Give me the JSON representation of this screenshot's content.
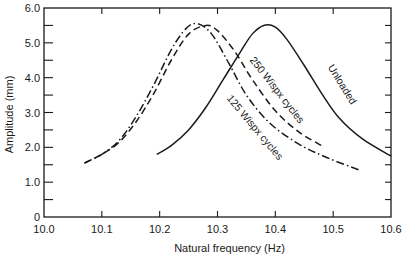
{
  "chart_data": {
    "type": "line",
    "title": "",
    "xlabel": "Natural frequency (Hz)",
    "ylabel": "Amplitude (mm)",
    "xlim": [
      10.0,
      10.6
    ],
    "ylim": [
      0,
      6.0
    ],
    "x_ticks": [
      10.0,
      10.1,
      10.2,
      10.3,
      10.4,
      10.5,
      10.6
    ],
    "x_tick_labels": [
      "10.0",
      "10.1",
      "10.2",
      "10.3",
      "10.4",
      "10.5",
      "10.6"
    ],
    "y_ticks": [
      0,
      1.0,
      2.0,
      3.0,
      4.0,
      5.0,
      6.0
    ],
    "y_tick_labels": [
      "0",
      "1.0",
      "2.0",
      "3.0",
      "4.0",
      "5.0",
      "6.0"
    ],
    "y_minor_step": 0.5,
    "grid": false,
    "legend": "none (inline curve labels)",
    "series": [
      {
        "name": "Unloaded",
        "style": "solid",
        "x": [
          10.195,
          10.22,
          10.25,
          10.28,
          10.31,
          10.34,
          10.36,
          10.38,
          10.4,
          10.42,
          10.45,
          10.48,
          10.51,
          10.55,
          10.6
        ],
        "y": [
          1.8,
          2.05,
          2.5,
          3.15,
          3.95,
          4.75,
          5.25,
          5.5,
          5.45,
          5.1,
          4.35,
          3.55,
          2.85,
          2.25,
          1.75
        ]
      },
      {
        "name": "250 Wispx cycles",
        "style": "dashed",
        "x": [
          10.07,
          10.1,
          10.13,
          10.16,
          10.19,
          10.22,
          10.25,
          10.28,
          10.3,
          10.33,
          10.36,
          10.4,
          10.44,
          10.48
        ],
        "y": [
          1.55,
          1.8,
          2.15,
          2.75,
          3.55,
          4.5,
          5.25,
          5.5,
          5.35,
          4.75,
          3.95,
          3.05,
          2.45,
          2.05
        ]
      },
      {
        "name": "125 Wispx cycles",
        "style": "dash-dot",
        "x": [
          10.07,
          10.1,
          10.13,
          10.16,
          10.19,
          10.22,
          10.245,
          10.265,
          10.29,
          10.32,
          10.35,
          10.39,
          10.44,
          10.49,
          10.545
        ],
        "y": [
          1.55,
          1.8,
          2.2,
          2.9,
          3.8,
          4.8,
          5.4,
          5.55,
          5.25,
          4.4,
          3.5,
          2.7,
          2.1,
          1.7,
          1.35
        ]
      }
    ],
    "annotations": [
      {
        "text": "250 Wispx cycles",
        "series": "250 Wispx cycles"
      },
      {
        "text": "125 Wispx cycles",
        "series": "125 Wispx cycles"
      },
      {
        "text": "Unloaded",
        "series": "Unloaded"
      }
    ]
  }
}
